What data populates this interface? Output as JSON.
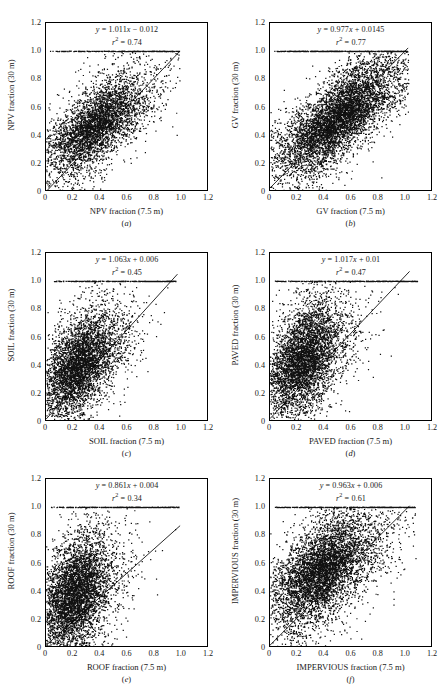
{
  "figure": {
    "tick_labels": [
      "0",
      "0.2",
      "0.4",
      "0.6",
      "0.8",
      "1.0",
      "1.2"
    ],
    "tick_values": [
      0,
      0.2,
      0.4,
      0.6,
      0.8,
      1.0,
      1.2
    ]
  },
  "chart_data": [
    {
      "type": "scatter",
      "panel": "(a)",
      "title": "",
      "xlabel": "NPV fraction (7.5 m)",
      "ylabel": "NPV fraction (30 m)",
      "xlim": [
        0,
        1.2
      ],
      "ylim": [
        0,
        1.2
      ],
      "xticks": [
        0,
        0.2,
        0.4,
        0.6,
        0.8,
        1.0,
        1.2
      ],
      "yticks": [
        0,
        0.2,
        0.4,
        0.6,
        0.8,
        1.0,
        1.2
      ],
      "grid": false,
      "legend": "none",
      "equation": "y = 1.011x − 0.012",
      "slope": 1.011,
      "intercept": -0.012,
      "r2_label": "r² = 0.74",
      "r2": 0.74,
      "n_points": 4200,
      "saturation_band_y": 1.0,
      "x_center": 0.36,
      "y_center": 0.46,
      "x_spread": 0.19,
      "y_spread": 0.18,
      "correlation": 0.7,
      "x_max_data": 1.0,
      "seed": 11
    },
    {
      "type": "scatter",
      "panel": "(b)",
      "title": "",
      "xlabel": "GV fraction (7.5 m)",
      "ylabel": "GV fraction (30 m)",
      "xlim": [
        0,
        1.2
      ],
      "ylim": [
        0,
        1.2
      ],
      "xticks": [
        0,
        0.2,
        0.4,
        0.6,
        0.8,
        1.0,
        1.2
      ],
      "yticks": [
        0,
        0.2,
        0.4,
        0.6,
        0.8,
        1.0,
        1.2
      ],
      "grid": false,
      "legend": "none",
      "equation": "y = 0.977x + 0.0145",
      "slope": 0.977,
      "intercept": 0.0145,
      "r2_label": "r² = 0.77",
      "r2": 0.77,
      "n_points": 6200,
      "saturation_band_y": 1.0,
      "x_center": 0.5,
      "y_center": 0.52,
      "x_spread": 0.24,
      "y_spread": 0.22,
      "correlation": 0.8,
      "x_max_data": 1.03,
      "seed": 23
    },
    {
      "type": "scatter",
      "panel": "(c)",
      "title": "",
      "xlabel": "SOIL fraction (7.5 m)",
      "ylabel": "SOIL fraction (30 m)",
      "xlim": [
        0,
        1.2
      ],
      "ylim": [
        0,
        1.2
      ],
      "xticks": [
        0,
        0.2,
        0.4,
        0.6,
        0.8,
        1.0,
        1.2
      ],
      "yticks": [
        0,
        0.2,
        0.4,
        0.6,
        0.8,
        1.0,
        1.2
      ],
      "grid": false,
      "legend": "none",
      "equation": "y = 1.063x + 0.006",
      "slope": 1.063,
      "intercept": 0.006,
      "r2_label": "r² = 0.45",
      "r2": 0.45,
      "n_points": 4600,
      "saturation_band_y": 1.0,
      "x_center": 0.24,
      "y_center": 0.4,
      "x_spread": 0.15,
      "y_spread": 0.19,
      "correlation": 0.55,
      "x_max_data": 0.98,
      "seed": 37
    },
    {
      "type": "scatter",
      "panel": "(d)",
      "title": "",
      "xlabel": "PAVED fraction (7.5 m)",
      "ylabel": "PAVED fraction (30 m)",
      "xlim": [
        0,
        1.2
      ],
      "ylim": [
        0,
        1.2
      ],
      "xticks": [
        0,
        0.2,
        0.4,
        0.6,
        0.8,
        1.0,
        1.2
      ],
      "yticks": [
        0,
        0.2,
        0.4,
        0.6,
        0.8,
        1.0,
        1.2
      ],
      "grid": false,
      "legend": "none",
      "equation": "y = 1.017x + 0.01",
      "slope": 1.017,
      "intercept": 0.01,
      "r2_label": "r² = 0.47",
      "r2": 0.47,
      "n_points": 4800,
      "saturation_band_y": 1.0,
      "x_center": 0.24,
      "y_center": 0.44,
      "x_spread": 0.15,
      "y_spread": 0.21,
      "correlation": 0.5,
      "x_max_data": 1.12,
      "seed": 53
    },
    {
      "type": "scatter",
      "panel": "(e)",
      "title": "",
      "xlabel": "ROOF fraction (7.5 m)",
      "ylabel": "ROOF fraction (30 m)",
      "xlim": [
        0,
        1.2
      ],
      "ylim": [
        0,
        1.2
      ],
      "xticks": [
        0,
        0.2,
        0.4,
        0.6,
        0.8,
        1.0,
        1.2
      ],
      "yticks": [
        0,
        0.2,
        0.4,
        0.6,
        0.8,
        1.0,
        1.2
      ],
      "grid": false,
      "legend": "none",
      "equation": "y = 0.861x + 0.004",
      "slope": 0.861,
      "intercept": 0.004,
      "r2_label": "r² = 0.34",
      "r2": 0.34,
      "n_points": 5000,
      "saturation_band_y": 1.0,
      "x_center": 0.21,
      "y_center": 0.37,
      "x_spread": 0.13,
      "y_spread": 0.21,
      "correlation": 0.42,
      "x_max_data": 1.0,
      "seed": 71
    },
    {
      "type": "scatter",
      "panel": "(f)",
      "title": "",
      "xlabel": "IMPERVIOUS fraction (7.5 m)",
      "ylabel": "IMPERVIOUS fraction (30 m)",
      "xlim": [
        0,
        1.2
      ],
      "ylim": [
        0,
        1.2
      ],
      "xticks": [
        0,
        0.2,
        0.4,
        0.6,
        0.8,
        1.0,
        1.2
      ],
      "yticks": [
        0,
        0.2,
        0.4,
        0.6,
        0.8,
        1.0,
        1.2
      ],
      "grid": false,
      "legend": "none",
      "equation": "y = 0.963x + 0.006",
      "slope": 0.963,
      "intercept": 0.006,
      "r2_label": "r² = 0.61",
      "r2": 0.61,
      "n_points": 5600,
      "saturation_band_y": 1.0,
      "x_center": 0.38,
      "y_center": 0.54,
      "x_spread": 0.2,
      "y_spread": 0.21,
      "correlation": 0.62,
      "x_max_data": 1.09,
      "seed": 97
    }
  ]
}
